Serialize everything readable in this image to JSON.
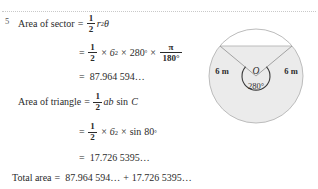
{
  "question": {
    "number": "5"
  },
  "solution": {
    "line1": {
      "label": "Area of sector",
      "equals": "=",
      "frac_num": "1",
      "frac_den": "2",
      "radius_var": "r",
      "radius_pow": "2",
      "theta": "θ"
    },
    "line2": {
      "equals": "=",
      "frac_num": "1",
      "frac_den": "2",
      "times1": "×",
      "base1": "6",
      "pow1": "2",
      "times2": "×",
      "angle": "280",
      "degree": "°",
      "times3": "×",
      "pi_num": "π",
      "pi_den": "180°"
    },
    "line3": {
      "equals": "=",
      "value": "87.964 594…"
    },
    "line4": {
      "label": "Area of triangle",
      "equals": "=",
      "frac_num": "1",
      "frac_den": "2",
      "expr": "ab",
      "sin": "sin",
      "angle_var": "C"
    },
    "line5": {
      "equals": "=",
      "frac_num": "1",
      "frac_den": "2",
      "times1": "×",
      "base1": "6",
      "pow1": "2",
      "times2": "×",
      "sin": "sin",
      "angle": "80",
      "degree": "°"
    },
    "line6": {
      "equals": "=",
      "value": "17.726 5395…"
    },
    "line7": {
      "label": "Total area",
      "equals": "=",
      "term1": "87.964 594…",
      "plus": "+",
      "term2": "17.726 5395…"
    }
  },
  "diagram": {
    "center_label": "O",
    "angle_label": "280°",
    "radius_left_label": "6 m",
    "radius_right_label": "6 m",
    "colors": {
      "shaded_fill": "#ebebeb",
      "unshaded_fill": "#ffffff",
      "outline": "#b6b6b6",
      "arc_stroke": "#3a3a3a",
      "text": "#2b2b2b"
    }
  },
  "page": {
    "rule_color": "#c9c9c9",
    "background": "#ffffff",
    "text_color": "#2b2b2b"
  }
}
